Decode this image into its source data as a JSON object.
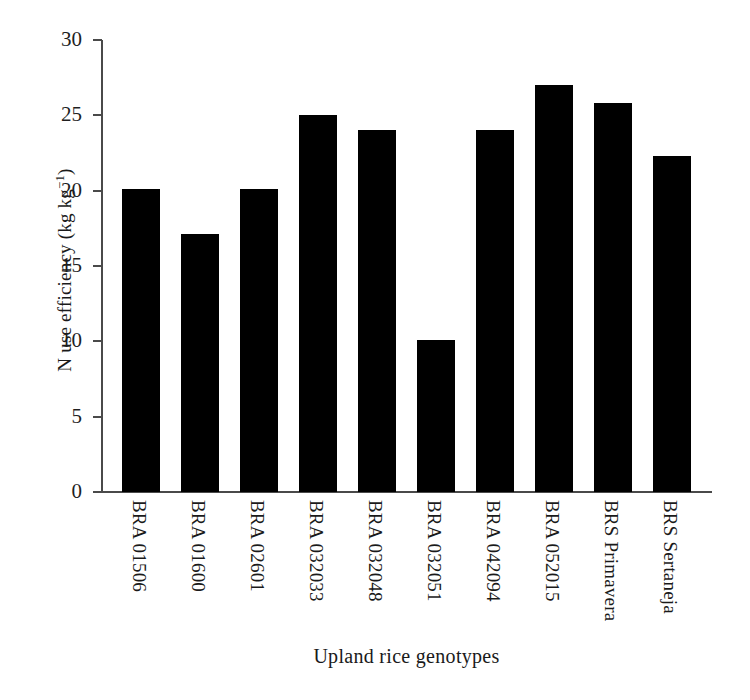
{
  "chart_data": {
    "type": "bar",
    "title": "",
    "xlabel": "Upland rice genotypes",
    "ylabel": "N use efficiency (kg kg-1)",
    "ylabel_parts": {
      "main": "N use efficiency (kg kg",
      "superscript": "−1",
      "tail": ")"
    },
    "categories": [
      "BRA 01506",
      "BRA 01600",
      "BRA 02601",
      "BRA 032033",
      "BRA 032048",
      "BRA 032051",
      "BRA 042094",
      "BRA 052015",
      "BRS Primavera",
      "BRS Sertaneja"
    ],
    "values": [
      20.1,
      17.1,
      20.1,
      25.0,
      24.0,
      10.1,
      24.0,
      27.0,
      25.8,
      22.3
    ],
    "ylim": [
      0,
      30
    ],
    "yticks": [
      0,
      5,
      10,
      15,
      20,
      25,
      30
    ],
    "ytick_labels": [
      "0",
      "5",
      "10",
      "15",
      "20",
      "25",
      "30"
    ],
    "grid": false,
    "legend": false,
    "bar_color": "#000000",
    "axis_color": "#4a4a4a"
  }
}
